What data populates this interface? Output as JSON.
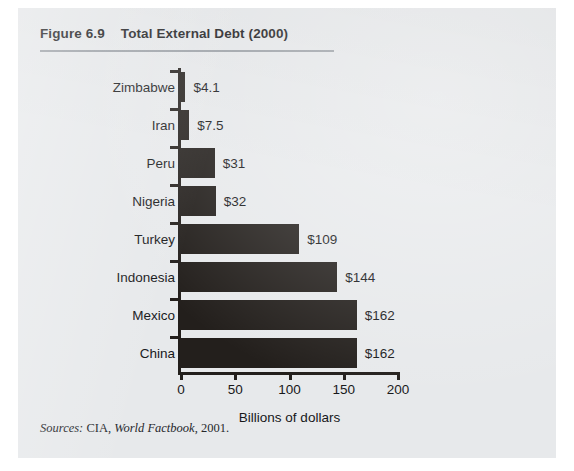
{
  "figure": {
    "number": "Figure 6.9",
    "title": "Total External Debt (2000)",
    "source_prefix": "Sources:",
    "source_org": " CIA, ",
    "source_publication": "World Factbook",
    "source_year": ", 2001."
  },
  "chart_data": {
    "type": "bar",
    "orientation": "horizontal",
    "title": "Total External Debt (2000)",
    "categories": [
      "Zimbabwe",
      "Iran",
      "Peru",
      "Nigeria",
      "Turkey",
      "Indonesia",
      "Mexico",
      "China"
    ],
    "values": [
      4.1,
      7.5,
      31,
      32,
      109,
      144,
      162,
      162
    ],
    "data_labels": [
      "$4.1",
      "$7.5",
      "$31",
      "$32",
      "$109",
      "$144",
      "$162",
      "$162"
    ],
    "xlabel": "Billions of dollars",
    "ylabel": "",
    "xlim": [
      0,
      200
    ],
    "xticks": [
      0,
      50,
      100,
      150,
      200
    ],
    "xtick_labels": [
      "0",
      "50",
      "100",
      "150",
      "200"
    ],
    "grid": false,
    "legend": false,
    "bar_color": "#231f1c",
    "background_color": "#e7e9eb"
  }
}
